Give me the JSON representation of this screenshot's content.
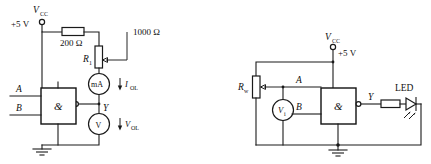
{
  "figure": {
    "background_color": "#ffffff",
    "line_color": "#1a1a1a"
  },
  "circuits": [
    {
      "id": "left-circuit",
      "name": "output-low-measurement-circuit",
      "supply": {
        "symbol_label": "V",
        "symbol_subscript": "CC",
        "voltage_label": "+5 V"
      },
      "components": [
        {
          "name": "series-resistor",
          "type": "resistor",
          "value_label": "200 Ω"
        },
        {
          "name": "variable-resistor",
          "type": "potentiometer",
          "designator": "R",
          "designator_subscript": "1",
          "value_label": "1000 Ω"
        },
        {
          "name": "current-meter",
          "type": "ammeter",
          "meter_label": "mA",
          "measure_symbol": "I",
          "measure_subscript": "OL"
        },
        {
          "name": "voltage-meter",
          "type": "voltmeter",
          "meter_label": "V",
          "measure_symbol": "V",
          "measure_subscript": "OL"
        },
        {
          "name": "nand-gate",
          "type": "logic-gate",
          "gate_symbol": "&",
          "inverted_output": true
        }
      ],
      "nets": {
        "input_a": "A",
        "input_b": "B",
        "output": "Y"
      }
    },
    {
      "id": "right-circuit",
      "name": "led-indicator-circuit",
      "supply": {
        "symbol_label": "V",
        "symbol_subscript": "CC",
        "voltage_label": "+5 V"
      },
      "components": [
        {
          "name": "input-potentiometer",
          "type": "potentiometer",
          "designator": "R",
          "designator_subscript": "w"
        },
        {
          "name": "input-voltmeter",
          "type": "voltmeter",
          "meter_label": "V",
          "meter_subscript": "i"
        },
        {
          "name": "nand-gate",
          "type": "logic-gate",
          "gate_symbol": "&",
          "inverted_output": true
        },
        {
          "name": "led-series-resistor",
          "type": "resistor",
          "value_label": ""
        },
        {
          "name": "led",
          "type": "light-emitting-diode",
          "label": "LED"
        }
      ],
      "nets": {
        "input_a": "A",
        "input_b": "B",
        "output": "Y"
      }
    }
  ]
}
